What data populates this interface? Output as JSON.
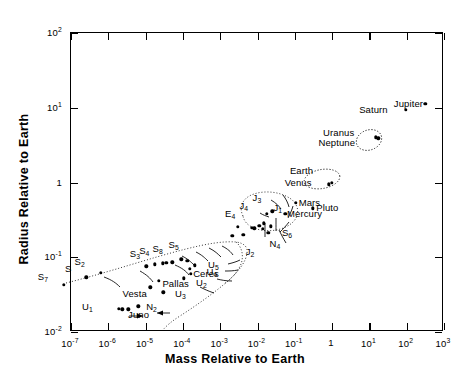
{
  "chart_data": {
    "type": "scatter",
    "title": "",
    "xlabel": "Mass Relative to Earth",
    "ylabel": "Radius Relative to Earth",
    "xscale": "log",
    "yscale": "log",
    "xlim": [
      1e-07,
      1000
    ],
    "ylim": [
      0.01,
      100
    ],
    "grid": false,
    "legend": null,
    "xticks": [
      {
        "value": 1e-07,
        "label": "10",
        "exp": "-7"
      },
      {
        "value": 1e-06,
        "label": "10",
        "exp": "-6"
      },
      {
        "value": 1e-05,
        "label": "10",
        "exp": "-5"
      },
      {
        "value": 0.0001,
        "label": "10",
        "exp": "-4"
      },
      {
        "value": 0.001,
        "label": "10",
        "exp": "-3"
      },
      {
        "value": 0.01,
        "label": "10",
        "exp": "-2"
      },
      {
        "value": 0.1,
        "label": "10",
        "exp": "-1"
      },
      {
        "value": 1,
        "label": "1",
        "exp": ""
      },
      {
        "value": 10,
        "label": "10",
        "exp": "1"
      },
      {
        "value": 100,
        "label": "10",
        "exp": "2"
      },
      {
        "value": 1000,
        "label": "10",
        "exp": "3"
      }
    ],
    "yticks": [
      {
        "value": 0.01,
        "label": "10",
        "exp": "-2"
      },
      {
        "value": 0.1,
        "label": "10",
        "exp": "-1"
      },
      {
        "value": 1,
        "label": "1",
        "exp": ""
      },
      {
        "value": 10,
        "label": "10",
        "exp": "1"
      },
      {
        "value": 100,
        "label": "10",
        "exp": "2"
      }
    ],
    "points": [
      {
        "name": "Jupiter",
        "x": 317.8,
        "y": 11.2,
        "label": "Jupiter",
        "lx": 292,
        "ly": 11.2,
        "anchor": "right"
      },
      {
        "name": "Saturn",
        "x": 95.2,
        "y": 9.45,
        "label": "Saturn",
        "lx": 33.0,
        "ly": 9.45,
        "anchor": "right"
      },
      {
        "name": "Uranus",
        "x": 14.6,
        "y": 4.0,
        "label": "Uranus",
        "lx": 4.2,
        "ly": 4.6,
        "anchor": "right"
      },
      {
        "name": "Neptune",
        "x": 17.2,
        "y": 3.88,
        "label": "Neptune",
        "lx": 4.4,
        "ly": 3.35,
        "anchor": "right"
      },
      {
        "name": "Earth",
        "x": 1.0,
        "y": 1.0,
        "label": "Earth",
        "lx": 0.33,
        "ly": 1.42,
        "anchor": "right"
      },
      {
        "name": "Venus",
        "x": 0.815,
        "y": 0.949,
        "label": "Venus",
        "lx": 0.3,
        "ly": 1.0,
        "anchor": "right"
      },
      {
        "name": "Mars",
        "x": 0.107,
        "y": 0.532,
        "label": "Mars",
        "lx": 0.135,
        "ly": 0.532,
        "anchor": "left"
      },
      {
        "name": "Mercury",
        "x": 0.0553,
        "y": 0.383,
        "label": "Mercury",
        "lx": 0.066,
        "ly": 0.383,
        "anchor": "left"
      },
      {
        "name": "Pluto",
        "x": 0.3,
        "y": 0.45,
        "label": "Pluto",
        "lx": 0.4,
        "ly": 0.45,
        "anchor": "left"
      },
      {
        "name": "J3",
        "x": 0.0248,
        "y": 0.413,
        "label": "J",
        "sub": "3",
        "lx": 0.0135,
        "ly": 0.6,
        "anchor": "right"
      },
      {
        "name": "J4",
        "x": 0.018,
        "y": 0.378,
        "label": "J",
        "sub": "4",
        "lx": 0.006,
        "ly": 0.475,
        "anchor": "right"
      },
      {
        "name": "J1",
        "x": 0.015,
        "y": 0.286,
        "label": "J",
        "sub": "1",
        "lx": 0.0285,
        "ly": 0.44,
        "anchor": "left"
      },
      {
        "name": "J2",
        "x": 0.0083,
        "y": 0.245,
        "label": "J",
        "sub": "2",
        "lx": 0.0088,
        "ly": 0.115,
        "anchor": "right"
      },
      {
        "name": "E4",
        "x": 0.003,
        "y": 0.255,
        "label": "E",
        "sub": "4",
        "lx": 0.0027,
        "ly": 0.365,
        "anchor": "right"
      },
      {
        "name": "S6",
        "x": 0.0225,
        "y": 0.258,
        "label": "S",
        "sub": "6",
        "lx": 0.048,
        "ly": 0.205,
        "anchor": "left"
      },
      {
        "name": "N4",
        "x": 0.0195,
        "y": 0.212,
        "label": "N",
        "sub": "4",
        "lx": 0.0222,
        "ly": 0.145,
        "anchor": "left"
      },
      {
        "name": "m1",
        "x": 0.007,
        "y": 0.25,
        "label": "",
        "lx": 0,
        "ly": 0,
        "anchor": "left"
      },
      {
        "name": "m2",
        "x": 0.0112,
        "y": 0.262,
        "label": "",
        "lx": 0,
        "ly": 0,
        "anchor": "left"
      },
      {
        "name": "m3",
        "x": 0.0137,
        "y": 0.238,
        "label": "",
        "lx": 0,
        "ly": 0,
        "anchor": "left"
      },
      {
        "name": "m4",
        "x": 0.0042,
        "y": 0.2,
        "label": "",
        "lx": 0,
        "ly": 0,
        "anchor": "left"
      },
      {
        "name": "m5",
        "x": 0.0021,
        "y": 0.192,
        "label": "",
        "lx": 0,
        "ly": 0,
        "anchor": "left"
      },
      {
        "name": "S5",
        "x": 9e-05,
        "y": 0.0935,
        "label": "S",
        "sub": "5",
        "lx": 8.3e-05,
        "ly": 0.142,
        "anchor": "right"
      },
      {
        "name": "S8",
        "x": 3.6e-05,
        "y": 0.0845,
        "label": "S",
        "sub": "8",
        "lx": 3.1e-05,
        "ly": 0.126,
        "anchor": "right"
      },
      {
        "name": "S4",
        "x": 1.75e-05,
        "y": 0.08,
        "label": "S",
        "sub": "4",
        "lx": 1.35e-05,
        "ly": 0.119,
        "anchor": "right"
      },
      {
        "name": "S3",
        "x": 1.05e-05,
        "y": 0.076,
        "label": "S",
        "sub": "3",
        "lx": 7.6e-06,
        "ly": 0.108,
        "anchor": "right"
      },
      {
        "name": "S2",
        "x": 6.4e-07,
        "y": 0.062,
        "label": "S",
        "sub": "2",
        "lx": 2.5e-07,
        "ly": 0.0835,
        "anchor": "right"
      },
      {
        "name": "S",
        "x": 2.6e-07,
        "y": 0.054,
        "label": "S",
        "lx": 1.1e-07,
        "ly": 0.0705,
        "anchor": "right"
      },
      {
        "name": "S7",
        "x": 6.5e-08,
        "y": 0.043,
        "label": "S",
        "sub": "7",
        "lx": 2.6e-08,
        "ly": 0.0535,
        "anchor": "right"
      },
      {
        "name": "U5",
        "x": 0.00021,
        "y": 0.078,
        "label": "U",
        "sub": "5",
        "lx": 0.0005,
        "ly": 0.076,
        "anchor": "left"
      },
      {
        "name": "U4",
        "x": 0.000155,
        "y": 0.07,
        "label": "U",
        "sub": "4",
        "lx": 0.00046,
        "ly": 0.061,
        "anchor": "left"
      },
      {
        "name": "U2",
        "x": 0.000105,
        "y": 0.0525,
        "label": "U",
        "sub": "2",
        "lx": 0.00024,
        "ly": 0.044,
        "anchor": "left"
      },
      {
        "name": "U3",
        "x": 3e-05,
        "y": 0.034,
        "label": "U",
        "sub": "3",
        "lx": 6.5e-05,
        "ly": 0.031,
        "anchor": "left"
      },
      {
        "name": "U1",
        "x": 1.9e-06,
        "y": 0.0205,
        "label": "U",
        "sub": "1",
        "lx": 4.1e-07,
        "ly": 0.0212,
        "anchor": "right"
      },
      {
        "name": "Ceres",
        "x": 0.00016,
        "y": 0.06,
        "label": "Ceres",
        "lx": 0.0002,
        "ly": 0.06,
        "anchor": "left"
      },
      {
        "name": "Pallas",
        "x": 2.3e-05,
        "y": 0.048,
        "label": "Pallas",
        "lx": 3e-05,
        "ly": 0.0445,
        "anchor": "left"
      },
      {
        "name": "Vesta",
        "x": 1.35e-05,
        "y": 0.0395,
        "label": "Vesta",
        "lx": 1.15e-05,
        "ly": 0.0318,
        "anchor": "right"
      },
      {
        "name": "Juno",
        "x": 3.4e-06,
        "y": 0.02,
        "label": "Juno",
        "lx": 3.6e-06,
        "ly": 0.0168,
        "anchor": "left"
      },
      {
        "name": "N2",
        "x": 6.3e-06,
        "y": 0.0222,
        "label": "N",
        "sub": "2",
        "lx": 1.1e-05,
        "ly": 0.021,
        "anchor": "left"
      },
      {
        "name": "a1",
        "x": 2.35e-06,
        "y": 0.02,
        "label": "",
        "lx": 0,
        "ly": 0,
        "anchor": "left"
      },
      {
        "name": "s1",
        "x": 2.9e-05,
        "y": 0.083,
        "label": "",
        "lx": 0,
        "ly": 0,
        "anchor": "left"
      },
      {
        "name": "s2",
        "x": 5.2e-05,
        "y": 0.0855,
        "label": "",
        "lx": 0,
        "ly": 0,
        "anchor": "left"
      },
      {
        "name": "s3",
        "x": 0.00013,
        "y": 0.09,
        "label": "",
        "lx": 0,
        "ly": 0,
        "anchor": "left"
      }
    ],
    "annotations": [
      {
        "kind": "ellipse",
        "name": "earth-venus-group"
      },
      {
        "kind": "ellipse",
        "name": "uranus-neptune-group"
      },
      {
        "kind": "dotted-envelope",
        "name": "satellite-asteroid-envelope"
      },
      {
        "kind": "dotted-envelope",
        "name": "inner-satellite-envelope"
      }
    ]
  }
}
